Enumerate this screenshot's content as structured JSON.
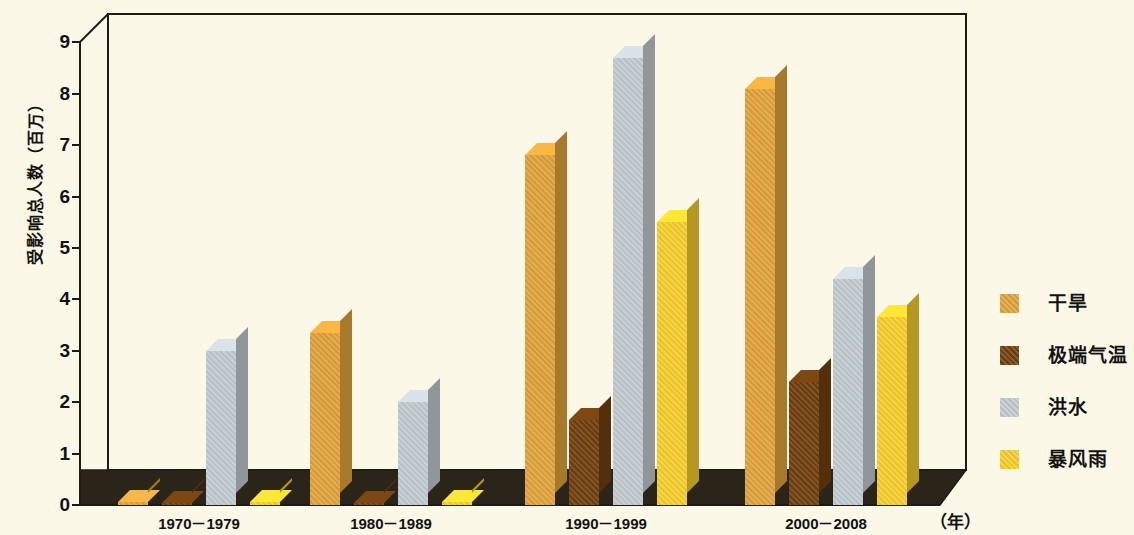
{
  "chart_data": {
    "type": "bar",
    "title": "",
    "xlabel": "（年）",
    "ylabel": "受影响总人数（百万）",
    "ylim": [
      0,
      9
    ],
    "yticks": [
      "0",
      "1",
      "2",
      "3",
      "4",
      "5",
      "6",
      "7",
      "8",
      "9"
    ],
    "grid": false,
    "legend_position": "right",
    "categories": [
      "1970－1979",
      "1980－1989",
      "1990－1999",
      "2000－2008"
    ],
    "series": [
      {
        "name": "干旱",
        "color": "#E0A33C",
        "values": [
          0.05,
          3.35,
          6.8,
          8.1
        ]
      },
      {
        "name": "极端气温",
        "color": "#70400F",
        "values": [
          0.0,
          0.0,
          1.65,
          2.4
        ]
      },
      {
        "name": "洪水",
        "color": "#C2CBD0",
        "values": [
          3.0,
          2.0,
          8.7,
          4.4
        ]
      },
      {
        "name": "暴风雨",
        "color": "#F5CE2E",
        "values": [
          0.05,
          0.05,
          5.5,
          3.65
        ]
      }
    ]
  },
  "axis": {
    "y_title": "受影响总人数（百万）",
    "x_unit": "（年）",
    "ticks": [
      "9",
      "8",
      "7",
      "6",
      "5",
      "4",
      "3",
      "2",
      "1",
      "0"
    ]
  },
  "legend": {
    "items": [
      {
        "label": "干旱",
        "color": "#E0A33C"
      },
      {
        "label": "极端气温",
        "color": "#70400F"
      },
      {
        "label": "洪水",
        "color": "#C2CBD0"
      },
      {
        "label": "暴风雨",
        "color": "#F5CE2E"
      }
    ]
  },
  "x_labels": [
    "1970－1979",
    "1980－1989",
    "1990－1999",
    "2000－2008"
  ],
  "colors": {
    "background": "#FBF8E8",
    "floor": "#2B2418",
    "frame": "#1b1b16"
  }
}
